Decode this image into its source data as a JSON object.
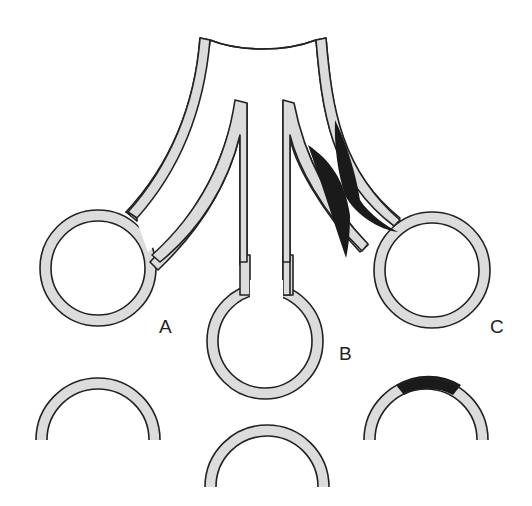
{
  "diagram": {
    "type": "anatomical schematic",
    "labels": [
      {
        "id": "A",
        "text": "A"
      },
      {
        "id": "B",
        "text": "B"
      },
      {
        "id": "C",
        "text": "C"
      }
    ],
    "colors": {
      "wall_fill": "#dcdcdc",
      "outline": "#222222",
      "lesion": "#1a1a1a",
      "background": "#ffffff"
    }
  }
}
